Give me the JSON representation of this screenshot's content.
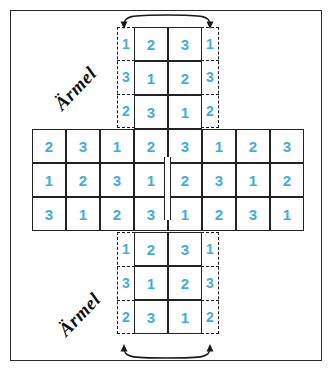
{
  "diagram": {
    "type": "knitting-pattern-cross-schematic",
    "accent_color": "#3FAEDC",
    "line_color": "#222222",
    "background_color": "#ffffff",
    "labels": {
      "sleeve_top": "Ärmel",
      "sleeve_bottom": "Ärmel"
    },
    "body_grid": {
      "name": "center-horizontal-band",
      "columns": 8,
      "rows": 3,
      "values": [
        [
          "2",
          "3",
          "1",
          "2",
          "3",
          "1",
          "2",
          "3"
        ],
        [
          "1",
          "2",
          "3",
          "1",
          "2",
          "3",
          "1",
          "2"
        ],
        [
          "3",
          "1",
          "2",
          "3",
          "1",
          "2",
          "3",
          "1"
        ]
      ]
    },
    "top_sleeve_grid": {
      "name": "top-arm-grid",
      "columns": 2,
      "rows": 3,
      "values": [
        [
          "2",
          "3"
        ],
        [
          "1",
          "2"
        ],
        [
          "3",
          "1"
        ]
      ],
      "left_margin_values": [
        "1",
        "3",
        "2"
      ],
      "right_margin_values": [
        "1",
        "3",
        "2"
      ]
    },
    "bottom_sleeve_grid": {
      "name": "bottom-arm-grid",
      "columns": 2,
      "rows": 3,
      "values": [
        [
          "2",
          "3"
        ],
        [
          "1",
          "2"
        ],
        [
          "3",
          "1"
        ]
      ],
      "left_margin_values": [
        "1",
        "3",
        "2"
      ],
      "right_margin_values": [
        "1",
        "3",
        "2"
      ]
    },
    "annotations": {
      "top_arrow": "curved-arc-with-two-arrowheads-pointing-down",
      "bottom_arrow": "curved-arc-with-two-arrowheads-pointing-up",
      "center_seam": "double-vertical-fold-line"
    }
  }
}
